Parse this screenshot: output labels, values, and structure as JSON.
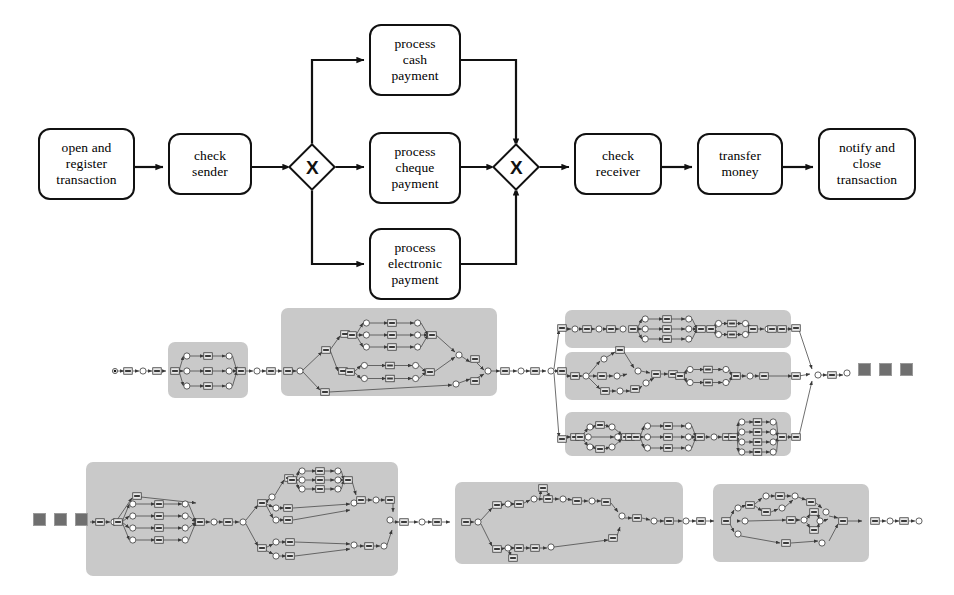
{
  "figure": {
    "kind": "two-part process-model figure",
    "top_model": {
      "notation": "BPMN-like flow chart",
      "tasks": [
        {
          "id": "t1",
          "lines": [
            "open and",
            "register",
            "transaction"
          ],
          "x": 38,
          "y": 128,
          "w": 97,
          "h": 72
        },
        {
          "id": "t2",
          "lines": [
            "check",
            "sender"
          ],
          "x": 168,
          "y": 133,
          "w": 84,
          "h": 62
        },
        {
          "id": "t3",
          "lines": [
            "process",
            "cash",
            "payment"
          ],
          "x": 369,
          "y": 24,
          "w": 92,
          "h": 72
        },
        {
          "id": "t4",
          "lines": [
            "process",
            "cheque",
            "payment"
          ],
          "x": 369,
          "y": 132,
          "w": 92,
          "h": 72
        },
        {
          "id": "t5",
          "lines": [
            "process",
            "electronic",
            "payment"
          ],
          "x": 369,
          "y": 228,
          "w": 92,
          "h": 72
        },
        {
          "id": "t6",
          "lines": [
            "check",
            "receiver"
          ],
          "x": 574,
          "y": 133,
          "w": 88,
          "h": 62
        },
        {
          "id": "t7",
          "lines": [
            "transfer",
            "money"
          ],
          "x": 697,
          "y": 133,
          "w": 86,
          "h": 62
        },
        {
          "id": "t8",
          "lines": [
            "notify and",
            "close",
            "transaction"
          ],
          "x": 818,
          "y": 128,
          "w": 98,
          "h": 72
        }
      ],
      "gateways": [
        {
          "id": "g1",
          "label": "X",
          "type": "exclusive-split",
          "cx": 312,
          "cy": 167
        },
        {
          "id": "g2",
          "label": "X",
          "type": "exclusive-join",
          "cx": 516,
          "cy": 167
        }
      ]
    },
    "bottom_model": {
      "notation": "Petri net with hierarchical sub-net blocks",
      "ellipsis_marker": "three filled squares",
      "ellipsis_groups": [
        {
          "id": "e1",
          "x": 858,
          "y": 363
        },
        {
          "id": "e2",
          "x": 33,
          "y": 513
        }
      ],
      "subnet_blocks": [
        {
          "id": "s1",
          "x": 168,
          "y": 342,
          "w": 80,
          "h": 56
        },
        {
          "id": "s2",
          "x": 281,
          "y": 308,
          "w": 216,
          "h": 88
        },
        {
          "id": "s3",
          "x": 565,
          "y": 310,
          "w": 226,
          "h": 38
        },
        {
          "id": "s4",
          "x": 565,
          "y": 352,
          "w": 226,
          "h": 48
        },
        {
          "id": "s5",
          "x": 565,
          "y": 412,
          "w": 226,
          "h": 44
        },
        {
          "id": "s6",
          "x": 86,
          "y": 462,
          "w": 312,
          "h": 114
        },
        {
          "id": "s7",
          "x": 455,
          "y": 482,
          "w": 228,
          "h": 82
        },
        {
          "id": "s8",
          "x": 713,
          "y": 484,
          "w": 156,
          "h": 78
        }
      ]
    }
  }
}
